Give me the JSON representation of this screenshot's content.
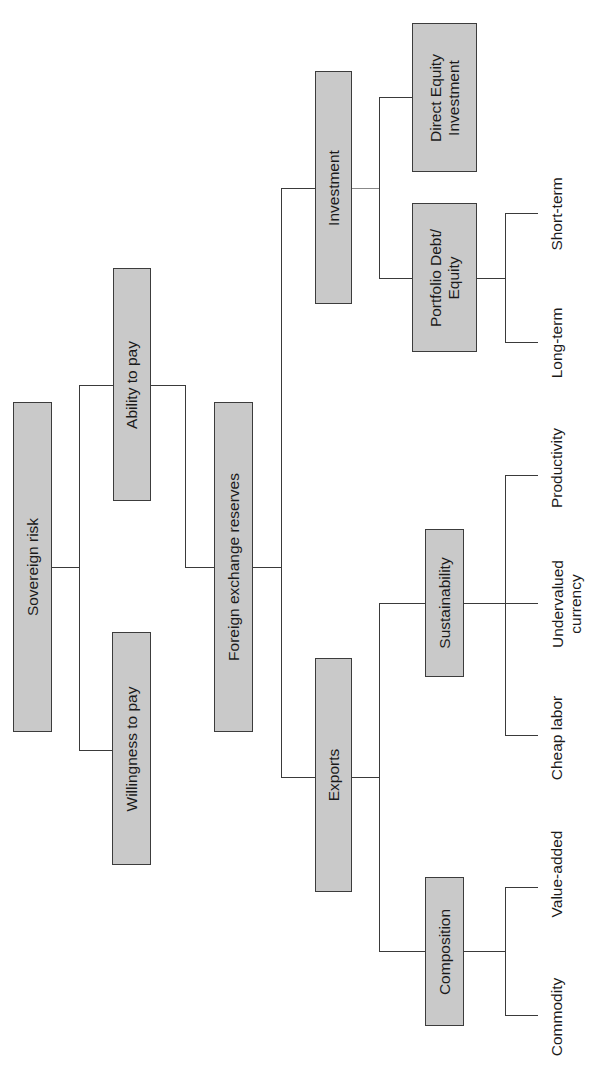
{
  "diagram": {
    "orientation": "rotated -90deg (tree grows left to right, labels read bottom-to-top)",
    "colors": {
      "box_fill": "#c9c9c9",
      "box_border": "#3c3c3c",
      "line": "#3a3a3a",
      "background": "#ffffff"
    },
    "root": {
      "label": "Sovereign risk"
    },
    "level1": {
      "willingness": {
        "label": "Willingness to pay"
      },
      "ability": {
        "label": "Ability to pay"
      }
    },
    "level2": {
      "fx": {
        "label": "Foreign exchange reserves"
      }
    },
    "level3": {
      "investment": {
        "label": "Investment"
      },
      "exports": {
        "label": "Exports"
      }
    },
    "level4": {
      "direct_equity": {
        "label_line1": "Direct Equity",
        "label_line2": "Investment"
      },
      "portfolio": {
        "label_line1": "Portfolio Debt/",
        "label_line2": "Equity"
      },
      "sustainability": {
        "label": "Sustainability"
      },
      "composition": {
        "label": "Composition"
      }
    },
    "leaves": {
      "short_term": "Short-term",
      "long_term": "Long-term",
      "productivity": "Productivity",
      "undervalued_line1": "Undervalued",
      "undervalued_line2": "currency",
      "cheap_labor": "Cheap labor",
      "value_added": "Value-added",
      "commodity": "Commodity"
    }
  }
}
